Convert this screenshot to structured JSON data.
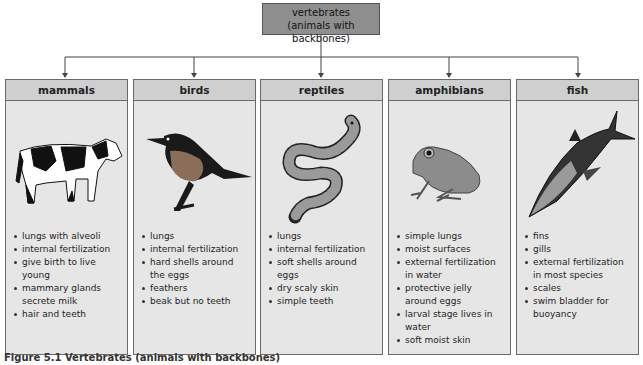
{
  "root": {
    "title": "vertebrates",
    "subtitle": "(animals with backbones)"
  },
  "colors": {
    "root_fill": "#8f8f8f",
    "header_fill": "#cfcfcf",
    "box_fill": "#e6e6e6",
    "line": "#444444"
  },
  "groups": [
    {
      "name": "mammals",
      "icon": "cow-illustration",
      "traits": [
        "lungs with alveoli",
        "internal fertilization",
        "give birth to live young",
        "mammary glands secrete milk",
        "hair and teeth"
      ]
    },
    {
      "name": "birds",
      "icon": "bird-illustration",
      "traits": [
        "lungs",
        "internal fertilization",
        "hard shells around the eggs",
        "feathers",
        "beak but no teeth"
      ]
    },
    {
      "name": "reptiles",
      "icon": "snake-illustration",
      "traits": [
        "lungs",
        "internal fertilization",
        "soft shells around eggs",
        "dry scaly skin",
        "simple teeth"
      ]
    },
    {
      "name": "amphibians",
      "icon": "frog-illustration",
      "traits": [
        "simple lungs",
        "moist surfaces",
        "external fertilization in water",
        "protective jelly around eggs",
        "larval stage lives in water",
        "soft moist skin"
      ]
    },
    {
      "name": "fish",
      "icon": "shark-illustration",
      "traits": [
        "fins",
        "gills",
        "external fertilization in most species",
        "scales",
        "swim bladder for buoyancy"
      ]
    }
  ],
  "caption": "Figure 5.1  Vertebrates (animals with backbones)"
}
